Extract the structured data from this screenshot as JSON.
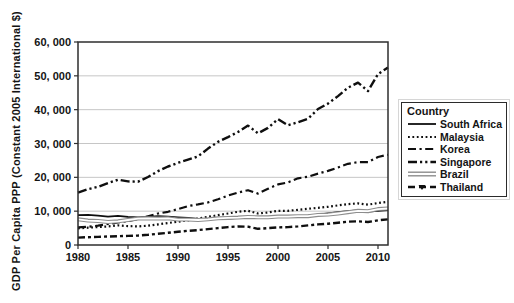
{
  "chart_data": {
    "type": "line",
    "title": "",
    "xlabel": "",
    "ylabel": "GDP Per Capita PPP (Constant 2005 International $)",
    "ylim": [
      0,
      60000
    ],
    "x_range": [
      1980,
      2011
    ],
    "grid": "horizontal",
    "y_ticks": [
      {
        "value": 0,
        "label": "0"
      },
      {
        "value": 10000,
        "label": "10, 000"
      },
      {
        "value": 20000,
        "label": "20, 000"
      },
      {
        "value": 30000,
        "label": "30, 000"
      },
      {
        "value": 40000,
        "label": "40, 000"
      },
      {
        "value": 50000,
        "label": "50, 000"
      },
      {
        "value": 60000,
        "label": "60, 000"
      }
    ],
    "x_ticks": [
      {
        "value": 1980,
        "label": "1980"
      },
      {
        "value": 1985,
        "label": "1985"
      },
      {
        "value": 1990,
        "label": "1990"
      },
      {
        "value": 1995,
        "label": "1995"
      },
      {
        "value": 2000,
        "label": "2000"
      },
      {
        "value": 2005,
        "label": "2005"
      },
      {
        "value": 2010,
        "label": "2010"
      }
    ],
    "legend": {
      "title": "Country",
      "position": "right"
    },
    "colors": {
      "line": "#0f0f0f",
      "brazil_gray": "#8d8d8d",
      "grid": "#c6c6c6",
      "axis": "#2e2e2e"
    },
    "years": [
      1980,
      1981,
      1982,
      1983,
      1984,
      1985,
      1986,
      1987,
      1988,
      1989,
      1990,
      1991,
      1992,
      1993,
      1994,
      1995,
      1996,
      1997,
      1998,
      1999,
      2000,
      2001,
      2002,
      2003,
      2004,
      2005,
      2006,
      2007,
      2008,
      2009,
      2010,
      2011
    ],
    "series": [
      {
        "name": "South Africa",
        "style": {
          "kind": "solid",
          "width": 1.8,
          "color": "#0f0f0f"
        },
        "values": [
          8800,
          8900,
          8700,
          8400,
          8600,
          8300,
          8200,
          8300,
          8500,
          8400,
          8200,
          8000,
          7700,
          7600,
          7700,
          7800,
          8000,
          8100,
          8000,
          8100,
          8300,
          8400,
          8500,
          8700,
          9000,
          9300,
          9700,
          10000,
          10200,
          9900,
          10100,
          10300
        ]
      },
      {
        "name": "Malaysia",
        "style": {
          "kind": "dotted",
          "dash": "1.8 2.6",
          "width": 2.2,
          "color": "#0f0f0f"
        },
        "values": [
          4900,
          5100,
          5300,
          5500,
          5800,
          5600,
          5500,
          5700,
          6100,
          6500,
          6900,
          7300,
          7800,
          8300,
          8800,
          9300,
          9800,
          10100,
          9300,
          9600,
          10100,
          10100,
          10400,
          10700,
          11000,
          11300,
          11700,
          12100,
          12300,
          11900,
          12400,
          12800
        ]
      },
      {
        "name": "Korea",
        "style": {
          "kind": "dash-dot",
          "dash": "8 3.5 2.2 3.5",
          "width": 2.2,
          "color": "#0f0f0f"
        },
        "values": [
          5200,
          5400,
          5700,
          6200,
          6700,
          7000,
          7700,
          8500,
          9300,
          9800,
          10600,
          11500,
          12000,
          12600,
          13500,
          14600,
          15500,
          16200,
          15200,
          16600,
          17900,
          18500,
          19700,
          20200,
          21100,
          21900,
          22900,
          24000,
          24500,
          24500,
          26000,
          26700
        ]
      },
      {
        "name": "Singapore",
        "style": {
          "kind": "dash-dot-dot",
          "dash": "9 3 2.2 3 2.2 3",
          "width": 2.4,
          "color": "#0f0f0f"
        },
        "values": [
          15500,
          16500,
          17200,
          18300,
          19300,
          18800,
          18700,
          20100,
          21800,
          23200,
          24300,
          25200,
          26200,
          28500,
          30500,
          31900,
          33400,
          35300,
          33000,
          34600,
          37200,
          35400,
          36300,
          37300,
          40200,
          41800,
          44000,
          46500,
          48000,
          45500,
          50500,
          52500
        ]
      },
      {
        "name": "Brazil",
        "style": {
          "kind": "double",
          "width": 4,
          "color": "#8d8d8d"
        },
        "values": [
          7600,
          7200,
          7100,
          6800,
          7000,
          7400,
          7800,
          7900,
          7800,
          7900,
          7500,
          7500,
          7400,
          7600,
          7900,
          8000,
          8100,
          8300,
          8200,
          8200,
          8400,
          8400,
          8500,
          8500,
          8900,
          9000,
          9300,
          9700,
          10100,
          10000,
          10600,
          10800
        ]
      },
      {
        "name": "Thailand",
        "style": {
          "kind": "dash-marker",
          "dash": "7 3 3 3",
          "width": 2.4,
          "color": "#0f0f0f"
        },
        "values": [
          2200,
          2300,
          2400,
          2500,
          2600,
          2700,
          2800,
          3000,
          3300,
          3600,
          3900,
          4200,
          4400,
          4700,
          5000,
          5300,
          5500,
          5400,
          4800,
          5000,
          5200,
          5300,
          5500,
          5800,
          6100,
          6300,
          6600,
          6900,
          7000,
          6800,
          7300,
          7600
        ]
      }
    ]
  }
}
